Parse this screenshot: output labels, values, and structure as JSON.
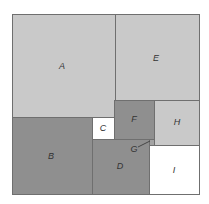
{
  "diagram": {
    "type": "nested-rectangles",
    "regions": [
      {
        "id": "A",
        "label": "A",
        "x": 12,
        "y": 14,
        "w": 103,
        "h": 103,
        "fill": "#c9c9c9",
        "lx": 62,
        "ly": 66
      },
      {
        "id": "E",
        "label": "E",
        "x": 115,
        "y": 14,
        "w": 85,
        "h": 86,
        "fill": "#c9c9c9",
        "lx": 156,
        "ly": 58
      },
      {
        "id": "B",
        "label": "B",
        "x": 12,
        "y": 117,
        "w": 80,
        "h": 78,
        "fill": "#8f8f8f",
        "lx": 51,
        "ly": 156
      },
      {
        "id": "C",
        "label": "C",
        "x": 92,
        "y": 117,
        "w": 22,
        "h": 22,
        "fill": "#ffffff",
        "lx": 103,
        "ly": 128
      },
      {
        "id": "F",
        "label": "F",
        "x": 114,
        "y": 100,
        "w": 40,
        "h": 39,
        "fill": "#8f8f8f",
        "lx": 134,
        "ly": 119
      },
      {
        "id": "H",
        "label": "H",
        "x": 154,
        "y": 100,
        "w": 46,
        "h": 45,
        "fill": "#c9c9c9",
        "lx": 177,
        "ly": 122
      },
      {
        "id": "D",
        "label": "D",
        "x": 92,
        "y": 139,
        "w": 57,
        "h": 56,
        "fill": "#8f8f8f",
        "lx": 120,
        "ly": 166
      },
      {
        "id": "G",
        "label": "G",
        "x": 149,
        "y": 139,
        "w": 5,
        "h": 6,
        "fill": "#a3a3a3",
        "lx": 134,
        "ly": 149
      },
      {
        "id": "I",
        "label": "I",
        "x": 149,
        "y": 145,
        "w": 51,
        "h": 50,
        "fill": "#ffffff",
        "lx": 174,
        "ly": 170
      }
    ]
  }
}
